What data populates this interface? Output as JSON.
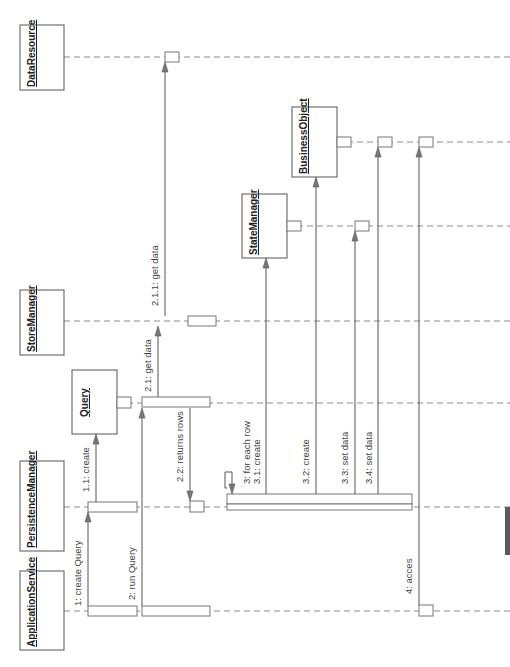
{
  "diagram": {
    "type": "UML sequence diagram (rotated 90° counter-clockwise)",
    "objects": [
      {
        "id": "data_resource",
        "label": "DataResource"
      },
      {
        "id": "store_manager",
        "label": "StoreManager"
      },
      {
        "id": "query",
        "label": "Query"
      },
      {
        "id": "persistence_manager",
        "label": "PersistenceManager"
      },
      {
        "id": "application_service",
        "label": "ApplicationService"
      },
      {
        "id": "state_manager",
        "label": "StateManager"
      },
      {
        "id": "business_object",
        "label": "BusinessObject"
      }
    ],
    "messages": [
      {
        "id": "m1",
        "label": "1: create Query",
        "from": "ApplicationService",
        "to": "PersistenceManager"
      },
      {
        "id": "m11",
        "label": "1.1: create",
        "from": "PersistenceManager",
        "to": "Query"
      },
      {
        "id": "m2",
        "label": "2: run Query",
        "from": "ApplicationService",
        "to": "Query"
      },
      {
        "id": "m21",
        "label": "2.1: get data",
        "from": "Query",
        "to": "StoreManager"
      },
      {
        "id": "m211",
        "label": "2.1.1: get data",
        "from": "StoreManager",
        "to": "DataResource"
      },
      {
        "id": "m22",
        "label": "2.2: returns rows",
        "from": "Query",
        "to": "PersistenceManager"
      },
      {
        "id": "m3",
        "label": "3: for each row",
        "from": "PersistenceManager",
        "to": "PersistenceManager"
      },
      {
        "id": "m31",
        "label": "3.1: create",
        "from": "PersistenceManager",
        "to": "StateManager"
      },
      {
        "id": "m32",
        "label": "3.2: create",
        "from": "PersistenceManager",
        "to": "BusinessObject"
      },
      {
        "id": "m33",
        "label": "3.3: set data",
        "from": "PersistenceManager",
        "to": "StateManager"
      },
      {
        "id": "m34",
        "label": "3.4: set data",
        "from": "PersistenceManager",
        "to": "BusinessObject"
      },
      {
        "id": "m4",
        "label": "4: acces",
        "from": "ApplicationService",
        "to": "BusinessObject"
      }
    ]
  },
  "colors": {
    "line": "#555555",
    "lifeline": "#8a8a8a",
    "arrow_fill": "#777777",
    "side_tab": "#5a5a5a",
    "background": "#ffffff"
  }
}
